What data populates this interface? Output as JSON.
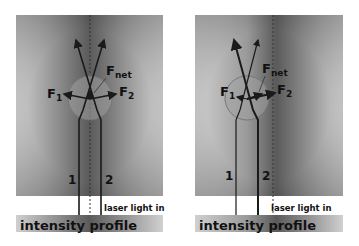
{
  "panels": [
    {
      "id": "left",
      "force_labels": {
        "f1": "F",
        "f1_sub": "1",
        "f2": "F",
        "f2_sub": "2",
        "fnet": "F",
        "fnet_sub": "net"
      },
      "beam_labels": {
        "beam1": "1",
        "beam2": "2"
      },
      "laser_label": "laser light in",
      "profile_label": "intensity profile"
    },
    {
      "id": "right",
      "force_labels": {
        "f1": "F",
        "f1_sub": "1",
        "f2": "F",
        "f2_sub": "2",
        "fnet": "F",
        "fnet_sub": "net"
      },
      "beam_labels": {
        "beam1": "1",
        "beam2": "2"
      },
      "laser_label": "laser light in",
      "profile_label": "intensity profile"
    }
  ],
  "colors": {
    "line": "#1a1a1a",
    "bead": "#9a9a9a",
    "bg_dark": "#555555",
    "bg_light": "#c8c8c8"
  }
}
